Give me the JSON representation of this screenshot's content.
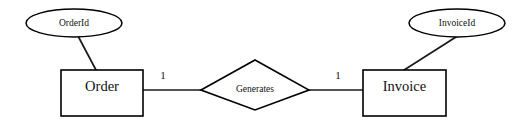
{
  "diagram": {
    "type": "entity-relationship-diagram",
    "notation": "chen",
    "background_color": "#ffffff",
    "line_color": "#111111",
    "entities": [
      {
        "id": "order",
        "label": "Order",
        "shape": "rectangle",
        "attributes": [
          {
            "id": "order-id",
            "label": "OrderId",
            "shape": "ellipse"
          }
        ]
      },
      {
        "id": "invoice",
        "label": "Invoice",
        "shape": "rectangle",
        "attributes": [
          {
            "id": "invoice-id",
            "label": "InvoiceId",
            "shape": "ellipse"
          }
        ]
      }
    ],
    "relationships": [
      {
        "id": "generates",
        "label": "Generates",
        "shape": "diamond",
        "from": "Order",
        "to": "Invoice",
        "cardinality_left": "1",
        "cardinality_right": "1",
        "cardinality_text": "1:1"
      }
    ]
  }
}
